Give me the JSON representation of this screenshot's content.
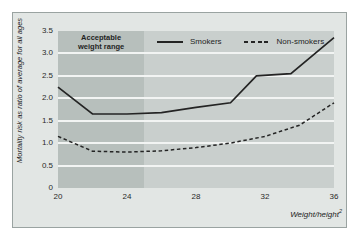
{
  "figure": {
    "band_label_lines": [
      "Acceptable",
      "weight range"
    ],
    "colors": {
      "figure_background": "#e2e6e4",
      "plot_background": "#c9cfcd",
      "acceptable_band": "#b7bfbc",
      "gridline": "#f2f4f3",
      "line": "#242424",
      "border": "#9aa3a1"
    }
  },
  "chart_data": {
    "type": "line",
    "title": "",
    "xlabel": "Weight/height²",
    "xlabel_base": "Weight/height",
    "xlabel_exp": "2",
    "ylabel": "Mortality risk as ratio of average for all ages",
    "xlim": [
      20,
      36
    ],
    "ylim": [
      0,
      3.5
    ],
    "x_ticks": [
      20,
      24,
      28,
      32,
      36
    ],
    "x_tick_labels": [
      "20",
      "24",
      "28",
      "32",
      "36"
    ],
    "y_ticks": [
      0,
      0.5,
      1,
      1.5,
      2,
      2.5,
      3,
      3.5
    ],
    "y_tick_labels": [
      "0",
      "0.5",
      "1.0",
      "1.5",
      "2.0",
      "2.5",
      "3.0",
      "3.5"
    ],
    "grid": "horizontal-only",
    "legend_position": "inside-top",
    "annotations": [
      {
        "type": "shaded-band",
        "label": "Acceptable weight range",
        "x_range": [
          20,
          25
        ]
      }
    ],
    "series": [
      {
        "name": "Smokers",
        "line_style": "solid",
        "points": [
          [
            20,
            2.25
          ],
          [
            22,
            1.65
          ],
          [
            24,
            1.65
          ],
          [
            26,
            1.68
          ],
          [
            28,
            1.8
          ],
          [
            30,
            1.9
          ],
          [
            31.5,
            2.5
          ],
          [
            33.5,
            2.55
          ],
          [
            36,
            3.35
          ]
        ]
      },
      {
        "name": "Non-smokers",
        "line_style": "dashed",
        "points": [
          [
            20,
            1.15
          ],
          [
            22,
            0.82
          ],
          [
            24,
            0.8
          ],
          [
            26,
            0.83
          ],
          [
            28,
            0.9
          ],
          [
            30,
            1.0
          ],
          [
            32,
            1.15
          ],
          [
            34,
            1.4
          ],
          [
            36,
            1.9
          ]
        ]
      }
    ]
  }
}
